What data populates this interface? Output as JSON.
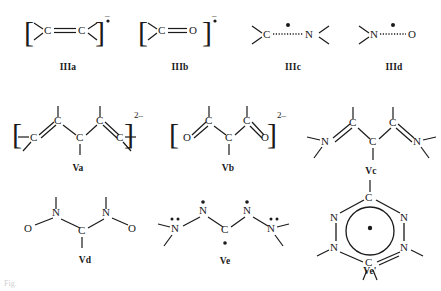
{
  "figure": {
    "background_color": "#ffffff",
    "ink_color": "#1a1a1a",
    "caption_fragment": "Fig.",
    "rows": 3,
    "columns": 4
  },
  "structures": [
    {
      "id": "IIIa",
      "label": "IIIa",
      "description": "alkene radical anion",
      "atoms": [
        "C",
        "C"
      ],
      "bond": "double",
      "brackets": true,
      "charge": "–",
      "radical": true,
      "charge_label": "–•"
    },
    {
      "id": "IIIb",
      "label": "IIIb",
      "description": "ketyl radical anion",
      "atoms": [
        "C",
        "O"
      ],
      "bond": "double",
      "brackets": true,
      "charge": "–",
      "radical": true,
      "charge_label": "–•"
    },
    {
      "id": "IIIc",
      "label": "IIIc",
      "description": "aminyl / iminyl delocalised radical",
      "atoms": [
        "C",
        "N"
      ],
      "bond": "dotted",
      "brackets": false,
      "charge": "",
      "radical": true,
      "charge_label": ""
    },
    {
      "id": "IIId",
      "label": "IIId",
      "description": "nitroxide radical",
      "atoms": [
        "N",
        "O"
      ],
      "bond": "dotted",
      "brackets": false,
      "charge": "",
      "radical": true,
      "charge_label": ""
    },
    {
      "id": "Va",
      "label": "Va",
      "description": "cross-conjugated carbon dianion chain",
      "atoms": [
        "C",
        "C",
        "C",
        "C",
        "C"
      ],
      "brackets": true,
      "charge": "2–",
      "radical": false,
      "charge_label": "2–"
    },
    {
      "id": "Vb",
      "label": "Vb",
      "description": "enolate dianion, O=C-C-C=O",
      "atoms": [
        "O",
        "C",
        "C",
        "C",
        "O"
      ],
      "brackets": true,
      "charge": "2–",
      "radical": false,
      "charge_label": "2–"
    },
    {
      "id": "Vc",
      "label": "Vc",
      "description": "di-imine chain, N=C-C-C=N",
      "atoms": [
        "N",
        "C",
        "C",
        "C",
        "N"
      ],
      "brackets": false,
      "charge": "",
      "radical": false,
      "charge_label": ""
    },
    {
      "id": "Vd",
      "label": "Vd",
      "description": "bis-nitroxide, O-N-C-N-O",
      "atoms": [
        "O",
        "N",
        "C",
        "N",
        "O"
      ],
      "brackets": false,
      "charge": "",
      "radical": false,
      "charge_label": ""
    },
    {
      "id": "Ve",
      "label": "Ve",
      "description": "tetrazane radical with lone pairs",
      "atoms": [
        "N",
        "N",
        "C",
        "N",
        "N"
      ],
      "brackets": false,
      "charge": "",
      "radical": true,
      "charge_label": ""
    },
    {
      "id": "Ve'",
      "label": "Ve'",
      "description": "aromatic tetrazine ring radical",
      "atoms": [
        "C",
        "N",
        "N",
        "N",
        "N",
        "C"
      ],
      "brackets": false,
      "charge": "",
      "radical": true,
      "charge_label": ""
    }
  ],
  "atom_labels": {
    "carbon": "C",
    "nitrogen": "N",
    "oxygen": "O"
  }
}
